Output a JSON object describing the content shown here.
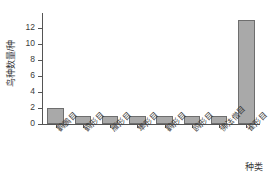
{
  "chart_data": {
    "type": "bar",
    "title": "",
    "subtitle": "",
    "xlabel": "种类",
    "ylabel": "鸟种数量/种",
    "categories": [
      "鹳鹏目",
      "鹤形目",
      "雁形目",
      "隼形目",
      "鹳形目",
      "鸥形目",
      "佛法僧目",
      "雀形目"
    ],
    "values": [
      2,
      1,
      1,
      1,
      1,
      1,
      1,
      13
    ],
    "ylim": [
      0,
      14
    ],
    "yticks": [
      0,
      2,
      4,
      6,
      8,
      10,
      12
    ],
    "ytick_labels": [
      "0",
      "2",
      "4",
      "6",
      "8",
      "10",
      "12"
    ],
    "grid": false,
    "legend": null,
    "legend_position": "none",
    "annotations": [],
    "bar_color": "#a9a9a9",
    "bar_edge_color": "#6e6e6e",
    "axis_color": "#555555",
    "text_color": "#3a3a3a",
    "background_color": "#ffffff"
  }
}
